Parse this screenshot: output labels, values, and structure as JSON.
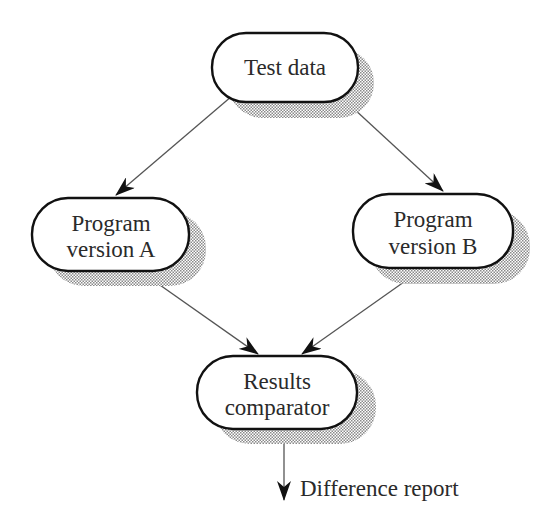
{
  "diagram": {
    "type": "flowchart",
    "nodes": [
      {
        "id": "test-data",
        "lines": [
          "Test data"
        ]
      },
      {
        "id": "program-a",
        "lines": [
          "Program",
          "version A"
        ]
      },
      {
        "id": "program-b",
        "lines": [
          "Program",
          "version B"
        ]
      },
      {
        "id": "comparator",
        "lines": [
          "Results",
          "comparator"
        ]
      }
    ],
    "edges": [
      {
        "from": "test-data",
        "to": "program-a"
      },
      {
        "from": "test-data",
        "to": "program-b"
      },
      {
        "from": "program-a",
        "to": "comparator"
      },
      {
        "from": "program-b",
        "to": "comparator"
      },
      {
        "from": "comparator",
        "to": "output"
      }
    ],
    "output_label": "Difference report"
  },
  "colors": {
    "stroke": "#111111",
    "line": "#555555",
    "shadow": "#9a9a9a",
    "text": "#2a2a2a",
    "fill": "#ffffff"
  }
}
